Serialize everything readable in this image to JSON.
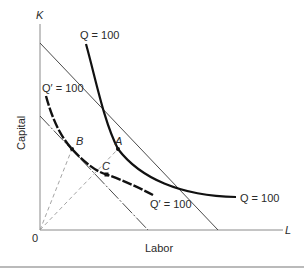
{
  "diagram": {
    "type": "isoquant-isocost",
    "axes": {
      "y_axis_symbol": "K",
      "x_axis_symbol": "L",
      "origin_label": "0",
      "y_axis_title": "Capital",
      "x_axis_title": "Labor"
    },
    "curves": {
      "isoquant_q": {
        "label_top": "Q = 100",
        "label_right": "Q = 100",
        "style": "solid-thick"
      },
      "isoquant_q_prime": {
        "label_top": "Q′ = 100",
        "label_right": "Q′ = 100",
        "style": "dashed-thick"
      },
      "isocost_outer": {
        "style": "solid-thin"
      },
      "isocost_inner": {
        "style": "dash-dot-thin"
      }
    },
    "points": [
      {
        "id": "A",
        "label": "A",
        "description": "tangency of outer isocost with Q = 100"
      },
      {
        "id": "B",
        "label": "B",
        "description": "tangency of inner isocost with Q' = 100"
      },
      {
        "id": "C",
        "label": "C",
        "description": "point on Q' = 100 along ray 0A"
      }
    ],
    "rays": [
      {
        "from": "0",
        "to": "B",
        "style": "dashed"
      },
      {
        "from": "0",
        "to": "A",
        "through": "C",
        "style": "dashed"
      }
    ],
    "colors": {
      "curve": "#111111",
      "isocost": "#4a4a4a",
      "axis": "#8a8a8a",
      "ray": "#9a9a9a",
      "text": "#2a2a2a"
    }
  }
}
